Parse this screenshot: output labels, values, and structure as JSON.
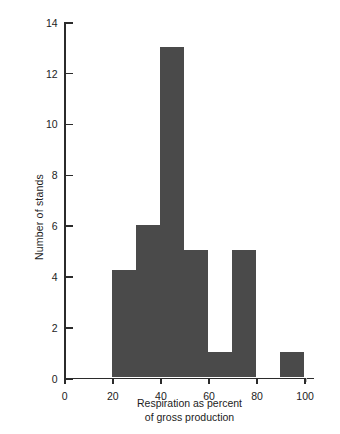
{
  "chart_data": {
    "type": "bar",
    "title": "",
    "subtitle": "",
    "xlabel_line1": "Respiration as percent",
    "xlabel_line2": "of gross production",
    "ylabel": "Number of stands",
    "xlim": [
      0,
      104
    ],
    "ylim": [
      0,
      14
    ],
    "grid": false,
    "legend": null,
    "bin_width": 10,
    "bar_color": "#4a4a4a",
    "axis_color": "#2b2b2b",
    "background_color": "#ffffff",
    "x_ticks": [
      {
        "value": 0,
        "label": "0"
      },
      {
        "value": 20,
        "label": "20"
      },
      {
        "value": 40,
        "label": "40"
      },
      {
        "value": 60,
        "label": "60"
      },
      {
        "value": 80,
        "label": "80"
      },
      {
        "value": 100,
        "label": "100"
      }
    ],
    "y_ticks": [
      {
        "value": 0,
        "label": "0"
      },
      {
        "value": 2,
        "label": "2"
      },
      {
        "value": 4,
        "label": "4"
      },
      {
        "value": 6,
        "label": "6"
      },
      {
        "value": 8,
        "label": "8"
      },
      {
        "value": 10,
        "label": "10"
      },
      {
        "value": 12,
        "label": "12"
      },
      {
        "value": 14,
        "label": "14"
      }
    ],
    "categories": [
      "20-30",
      "30-40",
      "40-50",
      "50-60",
      "60-70",
      "70-80",
      "80-90",
      "90-100"
    ],
    "bin_edges": [
      20,
      30,
      40,
      50,
      60,
      70,
      80,
      90,
      100
    ],
    "values": [
      4.2,
      6,
      13,
      5,
      1,
      5,
      0,
      1
    ],
    "bars": [
      {
        "x0": 20,
        "x1": 30,
        "value": 4.2
      },
      {
        "x0": 30,
        "x1": 40,
        "value": 6
      },
      {
        "x0": 40,
        "x1": 50,
        "value": 13
      },
      {
        "x0": 50,
        "x1": 60,
        "value": 5
      },
      {
        "x0": 60,
        "x1": 70,
        "value": 1
      },
      {
        "x0": 70,
        "x1": 80,
        "value": 5
      },
      {
        "x0": 80,
        "x1": 90,
        "value": 0
      },
      {
        "x0": 90,
        "x1": 100,
        "value": 1
      }
    ]
  }
}
